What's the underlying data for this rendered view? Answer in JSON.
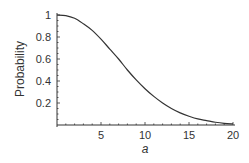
{
  "chart_data": {
    "type": "line",
    "title": "",
    "xlabel": "a",
    "ylabel": "Probability",
    "xlim": [
      0,
      20
    ],
    "ylim": [
      0,
      1
    ],
    "grid": false,
    "legend": null,
    "x_ticks": [
      5,
      10,
      15,
      20
    ],
    "y_ticks": [
      0.2,
      0.4,
      0.6,
      0.8,
      1
    ],
    "x_tick_labels": [
      "5",
      "10",
      "15",
      "20"
    ],
    "y_tick_labels": [
      "0.2",
      "0.4",
      "0.6",
      "0.8",
      "1"
    ],
    "series": [
      {
        "name": "Probability",
        "x": [
          0,
          1,
          2,
          3,
          4,
          5,
          6,
          7,
          8,
          9,
          10,
          11,
          12,
          13,
          14,
          15,
          16,
          17,
          18,
          19,
          20
        ],
        "values": [
          1.0,
          0.995,
          0.97,
          0.92,
          0.86,
          0.78,
          0.69,
          0.6,
          0.5,
          0.41,
          0.33,
          0.26,
          0.2,
          0.15,
          0.11,
          0.08,
          0.055,
          0.04,
          0.025,
          0.015,
          0.01
        ]
      }
    ]
  }
}
